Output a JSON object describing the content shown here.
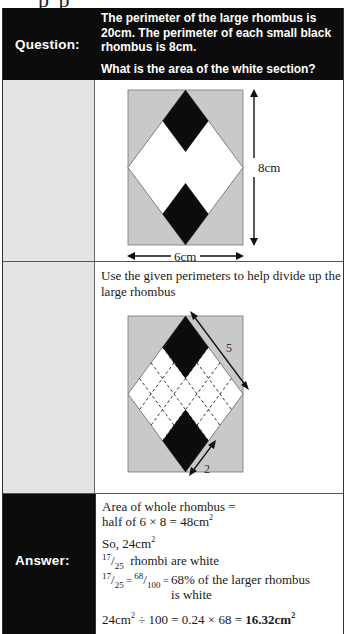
{
  "page_fragment": "p  p",
  "question": {
    "label": "Question:",
    "line1": "The perimeter of the large rhombus is 20cm. The perimeter of each small black rhombus is 8cm.",
    "line2": "What is the area of the white section?"
  },
  "diagram1": {
    "height_label": "8cm",
    "width_label": "6cm",
    "colors": {
      "background": "#c8c8c8",
      "white": "#ffffff",
      "black": "#0c0c0c"
    }
  },
  "step": {
    "text": "Use the given perimeters to help divide up the large rhombus",
    "diagram2": {
      "side_label": "5",
      "small_side_label": "2"
    }
  },
  "answer": {
    "label": "Answer:",
    "line1": "Area of whole rhombus =",
    "line2_pre": "half of 6 × 8 = 48cm",
    "line2_sup": "2",
    "line3_pre": "So, 24cm",
    "line3_sup": "2",
    "frac1_num": "17",
    "frac1_den": "25",
    "line4_post": " rhombi are white",
    "frac2_num": "17",
    "frac2_den": "25",
    "frac3_num": "68",
    "frac3_den": "100",
    "line5_post_a": "68% of the larger rhombus",
    "line5_post_b": "is white",
    "line6_a": "24cm",
    "line6_sup": "2",
    "line6_b": " ÷ 100 = 0.24 × 68 = ",
    "line6_result": "16.32cm",
    "line6_result_sup": "2"
  }
}
